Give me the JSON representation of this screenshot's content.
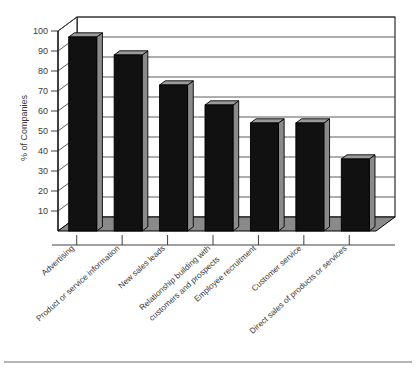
{
  "chart_data": {
    "type": "bar",
    "title": "",
    "subtitle": "",
    "xlabel": "",
    "ylabel": "% of Companies",
    "ylim": [
      0,
      100
    ],
    "ytick_step": 10,
    "yticks": [
      10,
      20,
      30,
      40,
      50,
      60,
      70,
      80,
      90,
      100
    ],
    "ytick_labels": [
      "10",
      "20",
      "30",
      "40",
      "50",
      "60",
      "70",
      "80",
      "90",
      "100"
    ],
    "grid": true,
    "legend": "none",
    "style": "3d-column",
    "categories": [
      "Advertising",
      "Product or service information",
      "New sales leads",
      "Relationship building with customers and prospects",
      "Employee recruitment",
      "Customer service",
      "Direct sales of products or services"
    ],
    "category_lines": [
      [
        "Advertising"
      ],
      [
        "Product or service information"
      ],
      [
        "New sales leads"
      ],
      [
        "Relationship building with",
        "customers and prospects"
      ],
      [
        "Employee recruitment"
      ],
      [
        "Customer service"
      ],
      [
        "Direct sales of products or services"
      ]
    ],
    "values": [
      97,
      88,
      73,
      63,
      54,
      54,
      36
    ],
    "colors": {
      "bar_face": "#111111",
      "bar_side": "#8a8a8a",
      "bar_top": "#9a9a9a",
      "floor": "#8a8a8a",
      "frame": "#000000",
      "grid": "#4a4a4a",
      "text": "#3a3a3a",
      "background": "#ffffff",
      "bottom_rule": "#6d6d6d"
    }
  },
  "figure": {
    "bottom_rule_present": true
  }
}
